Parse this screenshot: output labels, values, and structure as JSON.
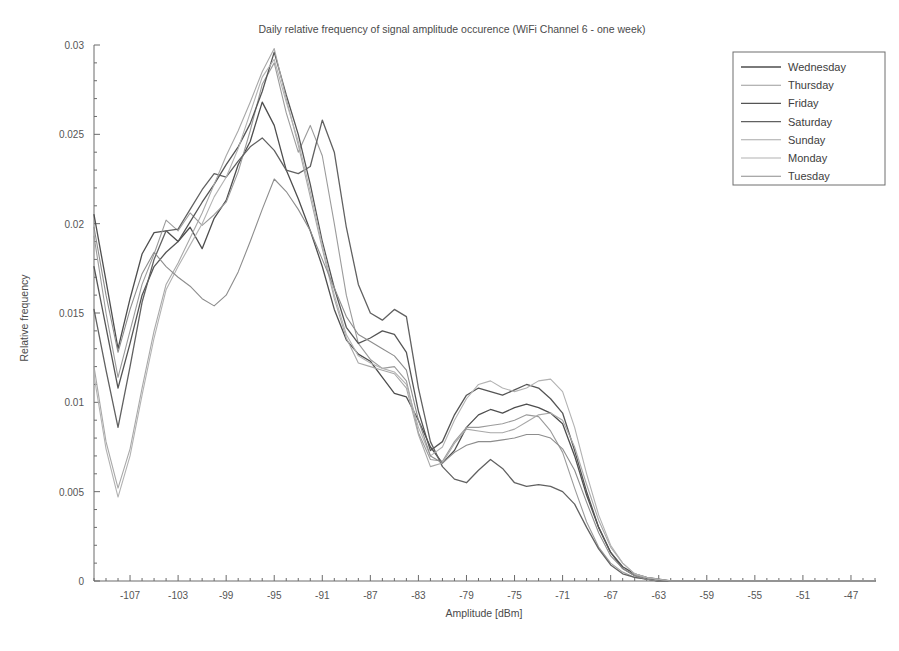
{
  "chart_data": {
    "type": "line",
    "title": "Daily relative frequency of signal amplitude occurence (WiFi Channel 6 - one week)",
    "xlabel": "Amplitude [dBm]",
    "ylabel": "Relative frequency",
    "xlim": [
      -110,
      -45
    ],
    "ylim": [
      0,
      0.03
    ],
    "grid": false,
    "legend_position": "upper-right",
    "xticks": [
      -107,
      -103,
      -99,
      -95,
      -91,
      -87,
      -83,
      -79,
      -75,
      -71,
      -67,
      -63,
      -59,
      -55,
      -51,
      -47
    ],
    "xtick_labels": [
      "-107",
      "-103",
      "-99",
      "-95",
      "-91",
      "-87",
      "-83",
      "-79",
      "-75",
      "-71",
      "-67",
      "-63",
      "-59",
      "-55",
      "-51",
      "-47"
    ],
    "xticks_minor_step": 1,
    "yticks": [
      0,
      0.005,
      0.01,
      0.015,
      0.02,
      0.025,
      0.03
    ],
    "ytick_labels": [
      "0",
      "0.005",
      "0.01",
      "0.015",
      "0.02",
      "0.025",
      "0.03"
    ],
    "x": [
      -110,
      -109,
      -108,
      -107,
      -106,
      -105,
      -104,
      -103,
      -102,
      -101,
      -100,
      -99,
      -98,
      -97,
      -96,
      -95,
      -94,
      -93,
      -92,
      -91,
      -90,
      -89,
      -88,
      -87,
      -86,
      -85,
      -84,
      -83,
      -82,
      -81,
      -80,
      -79,
      -78,
      -77,
      -76,
      -75,
      -74,
      -73,
      -72,
      -71,
      -70,
      -69,
      -68,
      -67,
      -66,
      -65,
      -64,
      -63,
      -62,
      -61,
      -60,
      -59,
      -58,
      -57,
      -56,
      -55,
      -54,
      -53,
      -52,
      -51,
      -50,
      -49,
      -48,
      -47,
      -46,
      -45
    ],
    "series": [
      {
        "name": "Wednesday",
        "color": "#4e4e4e",
        "width": 1.3,
        "values": [
          0.0205,
          0.0168,
          0.013,
          0.0158,
          0.0183,
          0.0195,
          0.0196,
          0.019,
          0.0198,
          0.0186,
          0.0203,
          0.0213,
          0.0233,
          0.0246,
          0.0268,
          0.0255,
          0.023,
          0.0214,
          0.0196,
          0.0176,
          0.0152,
          0.0135,
          0.0127,
          0.0123,
          0.0114,
          0.0105,
          0.0103,
          0.009,
          0.0075,
          0.0066,
          0.0073,
          0.0086,
          0.0093,
          0.0096,
          0.0094,
          0.0097,
          0.0099,
          0.0097,
          0.0094,
          0.0088,
          0.007,
          0.0048,
          0.003,
          0.0016,
          0.0008,
          0.0004,
          0.0002,
          0.0001,
          0.0,
          0.0,
          0.0,
          0.0,
          0.0,
          0.0,
          0.0,
          0.0,
          0.0,
          0.0,
          0.0,
          0.0,
          0.0,
          0.0,
          0.0,
          0.0,
          0.0,
          0.0
        ]
      },
      {
        "name": "Thursday",
        "color": "#9b9b9b",
        "width": 1.1,
        "values": [
          0.0193,
          0.015,
          0.0114,
          0.014,
          0.0166,
          0.0183,
          0.0202,
          0.0196,
          0.0206,
          0.0199,
          0.0205,
          0.0212,
          0.0229,
          0.0252,
          0.0278,
          0.029,
          0.0262,
          0.024,
          0.0255,
          0.0238,
          0.02,
          0.016,
          0.0133,
          0.0124,
          0.0119,
          0.012,
          0.0112,
          0.0083,
          0.0068,
          0.0067,
          0.0078,
          0.0086,
          0.0086,
          0.0087,
          0.0088,
          0.009,
          0.0093,
          0.0092,
          0.0084,
          0.0072,
          0.0052,
          0.0033,
          0.0019,
          0.001,
          0.0005,
          0.0002,
          0.0001,
          0.0,
          0.0,
          0.0,
          0.0,
          0.0,
          0.0,
          0.0,
          0.0,
          0.0,
          0.0,
          0.0,
          0.0,
          0.0,
          0.0,
          0.0,
          0.0,
          0.0,
          0.0,
          0.0
        ]
      },
      {
        "name": "Friday",
        "color": "#555555",
        "width": 1.3,
        "values": [
          0.0176,
          0.0142,
          0.0108,
          0.0133,
          0.016,
          0.0176,
          0.0184,
          0.019,
          0.0201,
          0.0212,
          0.0222,
          0.0233,
          0.0243,
          0.0256,
          0.0274,
          0.0296,
          0.0272,
          0.025,
          0.0222,
          0.019,
          0.0164,
          0.0142,
          0.0133,
          0.0136,
          0.014,
          0.0138,
          0.0128,
          0.0095,
          0.0073,
          0.0078,
          0.0093,
          0.0104,
          0.0108,
          0.0106,
          0.0104,
          0.0107,
          0.011,
          0.0108,
          0.0102,
          0.0094,
          0.0073,
          0.005,
          0.003,
          0.0016,
          0.0007,
          0.0003,
          0.0001,
          0.0,
          0.0,
          0.0,
          0.0,
          0.0,
          0.0,
          0.0,
          0.0,
          0.0,
          0.0,
          0.0,
          0.0,
          0.0,
          0.0,
          0.0,
          0.0,
          0.0,
          0.0,
          0.0
        ]
      },
      {
        "name": "Saturday",
        "color": "#616161",
        "width": 1.3,
        "values": [
          0.0152,
          0.0118,
          0.0086,
          0.012,
          0.0156,
          0.018,
          0.0196,
          0.0197,
          0.0208,
          0.0219,
          0.0228,
          0.0226,
          0.0235,
          0.0243,
          0.0248,
          0.0241,
          0.023,
          0.0228,
          0.0232,
          0.0258,
          0.024,
          0.0198,
          0.0166,
          0.015,
          0.0146,
          0.0152,
          0.0148,
          0.0108,
          0.0078,
          0.0064,
          0.0057,
          0.0055,
          0.0062,
          0.0068,
          0.0063,
          0.0055,
          0.0053,
          0.0054,
          0.0053,
          0.005,
          0.0043,
          0.003,
          0.0018,
          0.0009,
          0.0004,
          0.0002,
          0.0001,
          0.0,
          0.0,
          0.0,
          0.0,
          0.0,
          0.0,
          0.0,
          0.0,
          0.0,
          0.0,
          0.0,
          0.0,
          0.0,
          0.0,
          0.0,
          0.0,
          0.0,
          0.0,
          0.0
        ]
      },
      {
        "name": "Sunday",
        "color": "#a8a8a8",
        "width": 1.1,
        "values": [
          0.012,
          0.0078,
          0.0052,
          0.0074,
          0.0108,
          0.014,
          0.0166,
          0.0178,
          0.0192,
          0.0206,
          0.0222,
          0.0238,
          0.0252,
          0.0268,
          0.0285,
          0.0298,
          0.027,
          0.0244,
          0.0215,
          0.0186,
          0.0158,
          0.0136,
          0.0122,
          0.012,
          0.0118,
          0.0116,
          0.0108,
          0.0082,
          0.0064,
          0.0066,
          0.0077,
          0.0085,
          0.0084,
          0.0083,
          0.0083,
          0.0085,
          0.0089,
          0.0093,
          0.0094,
          0.009,
          0.0075,
          0.0054,
          0.0034,
          0.0019,
          0.001,
          0.0004,
          0.0002,
          0.0001,
          0.0,
          0.0,
          0.0,
          0.0,
          0.0,
          0.0,
          0.0,
          0.0,
          0.0,
          0.0,
          0.0,
          0.0,
          0.0,
          0.0,
          0.0,
          0.0,
          0.0,
          0.0
        ]
      },
      {
        "name": "Monday",
        "color": "#b2b2b2",
        "width": 1.1,
        "values": [
          0.0115,
          0.0074,
          0.0047,
          0.007,
          0.0104,
          0.0136,
          0.0163,
          0.0176,
          0.0188,
          0.02,
          0.0215,
          0.0226,
          0.0242,
          0.0262,
          0.0282,
          0.0292,
          0.0268,
          0.0246,
          0.0218,
          0.0188,
          0.016,
          0.0138,
          0.0126,
          0.0122,
          0.0119,
          0.0117,
          0.011,
          0.0086,
          0.007,
          0.0075,
          0.009,
          0.0102,
          0.011,
          0.0112,
          0.0108,
          0.0106,
          0.0108,
          0.0112,
          0.0113,
          0.0106,
          0.0086,
          0.006,
          0.0037,
          0.002,
          0.001,
          0.0004,
          0.0002,
          0.0001,
          0.0,
          0.0,
          0.0,
          0.0,
          0.0,
          0.0,
          0.0,
          0.0,
          0.0,
          0.0,
          0.0,
          0.0,
          0.0,
          0.0,
          0.0,
          0.0,
          0.0,
          0.0
        ]
      },
      {
        "name": "Tuesday",
        "color": "#8d8d8d",
        "width": 1.1,
        "values": [
          0.0198,
          0.016,
          0.0128,
          0.0152,
          0.0172,
          0.0184,
          0.0176,
          0.017,
          0.0165,
          0.0158,
          0.0154,
          0.016,
          0.0173,
          0.019,
          0.0208,
          0.0225,
          0.0218,
          0.0208,
          0.0196,
          0.018,
          0.0164,
          0.0148,
          0.0138,
          0.0134,
          0.013,
          0.0126,
          0.0118,
          0.009,
          0.007,
          0.0066,
          0.0072,
          0.0076,
          0.0078,
          0.0078,
          0.0079,
          0.008,
          0.0082,
          0.0082,
          0.008,
          0.0074,
          0.0062,
          0.0044,
          0.0027,
          0.0014,
          0.0007,
          0.0003,
          0.0001,
          0.0,
          0.0,
          0.0,
          0.0,
          0.0,
          0.0,
          0.0,
          0.0,
          0.0,
          0.0,
          0.0,
          0.0,
          0.0,
          0.0,
          0.0,
          0.0,
          0.0,
          0.0,
          0.0
        ]
      }
    ]
  }
}
